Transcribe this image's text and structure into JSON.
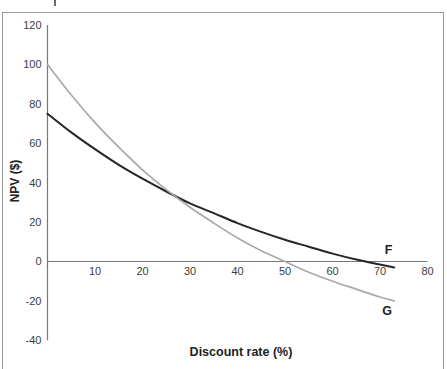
{
  "chart_data": {
    "type": "line",
    "xlabel": "Discount rate (%)",
    "ylabel": "NPV ($)",
    "xlim": [
      0,
      80
    ],
    "ylim": [
      -40,
      120
    ],
    "x_ticks": [
      10,
      20,
      30,
      40,
      50,
      60,
      70,
      80
    ],
    "y_ticks": [
      120,
      100,
      80,
      60,
      40,
      20,
      0,
      -20,
      -40
    ],
    "grid": false,
    "legend_position": "inline-curve-end-labels",
    "x": [
      0,
      5,
      10,
      15,
      20,
      25,
      30,
      35,
      40,
      45,
      50,
      55,
      60,
      65,
      70,
      73
    ],
    "series": [
      {
        "name": "F",
        "color": "#262626",
        "stroke_width": 2,
        "values": [
          75,
          65.5,
          57,
          49,
          42,
          35.5,
          29.5,
          24.5,
          19.5,
          15,
          11,
          7.5,
          4,
          1,
          -1.5,
          -3
        ]
      },
      {
        "name": "G",
        "color": "#a9a9a9",
        "stroke_width": 1.7,
        "values": [
          100,
          84.5,
          70.5,
          58,
          46.5,
          36.5,
          27.5,
          19.5,
          12,
          5.5,
          0,
          -5.5,
          -10,
          -14,
          -18,
          -20
        ]
      }
    ],
    "annotations": [
      {
        "text": "F",
        "x": 71.8,
        "y": 6
      },
      {
        "text": "G",
        "x": 71.5,
        "y": -25
      }
    ],
    "notes": {
      "f_intercept_y": 75,
      "g_intercept_y": 100,
      "crossover_point": [
        25,
        35.5
      ],
      "f_zero_crossing_x": 67,
      "g_zero_crossing_x": 50
    }
  },
  "colors": {
    "axis": "#787878",
    "tick_text": "#3d3d3d",
    "frame": "#999999",
    "label_text": "#222222",
    "background": "#ffffff"
  }
}
